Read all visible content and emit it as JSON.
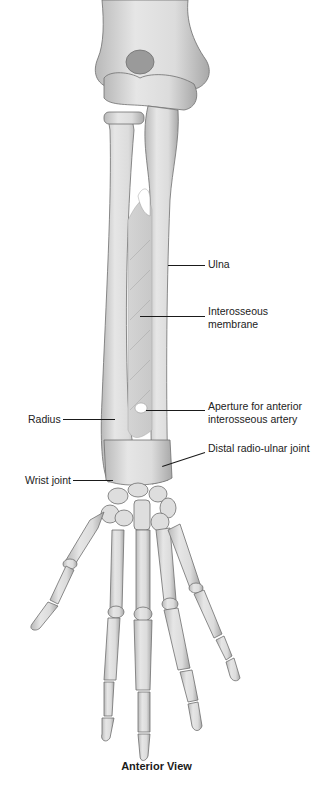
{
  "figure": {
    "caption": "Anterior View",
    "colors": {
      "bone_fill": "#e2e2e2",
      "bone_shade": "#b8b8b8",
      "bone_outline": "#6e6e6e",
      "label_text": "#222222",
      "leader_line": "#1a1a1a",
      "background": "#ffffff"
    }
  },
  "labels": {
    "ulna": "Ulna",
    "interosseous_line1": "Interosseous",
    "interosseous_line2": "membrane",
    "aperture_line1": "Aperture for anterior",
    "aperture_line2": "interosseous artery",
    "distal_radioulnar": "Distal radio-ulnar joint",
    "radius": "Radius",
    "wrist_joint": "Wrist joint"
  }
}
